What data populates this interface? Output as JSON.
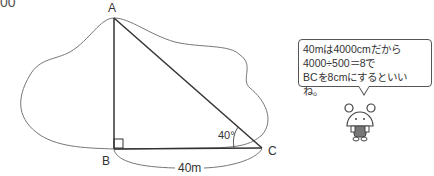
{
  "corner_fragment": "00",
  "diagram": {
    "vertices": {
      "A": "A",
      "B": "B",
      "C": "C"
    },
    "angle_label": "40°",
    "side_label": "40m"
  },
  "speech_bubble": {
    "lines": [
      "40mは4000cmだから",
      "4000÷500＝8で",
      "BCを8cmにするといいね。"
    ]
  },
  "character": {
    "name": "bear-mascot"
  }
}
